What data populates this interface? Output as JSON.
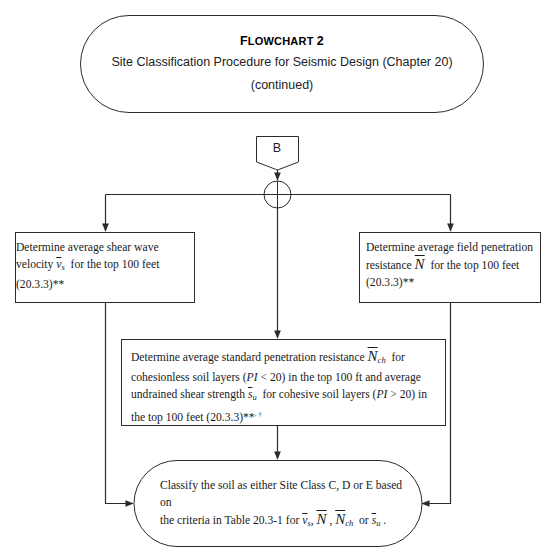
{
  "title_block": {
    "label_prefix": "F",
    "label_rest": "LOWCHART",
    "label_number": "2",
    "subtitle": "Site Classification Procedure for Seismic Design (Chapter 20)",
    "continuation": "(continued)"
  },
  "connector": {
    "label": "B"
  },
  "left_box": {
    "line1": "Determine average shear wave",
    "line2_pre": "velocity ",
    "symbol": "v",
    "symbol_sub": "s",
    "line2_post": "  for the top 100 feet",
    "line3": "(20.3.3)**"
  },
  "right_box": {
    "line1": "Determine average field penetration",
    "line2_pre": "resistance ",
    "symbol": "N",
    "line2_post": "  for the top 100 feet",
    "line3": "(20.3.3)**"
  },
  "middle_box": {
    "line1_pre": "Determine average standard penetration resistance ",
    "symbol1": "N",
    "symbol1_sub": "ch",
    "line1_post": "  for",
    "line2_pre": "cohesionless soil layers (",
    "pi": "PI",
    "line2_mid": " < 20) in the top 100 ft and average",
    "line3_pre": "undrained shear strength ",
    "symbol2": "s",
    "symbol2_sub": "u",
    "line3_mid": "  for cohesive soil layers (",
    "line3_post": " > 20) in",
    "line4": "the top 100 feet (20.3.3)**",
    "line4_sup": ", †"
  },
  "end_box": {
    "line1": "Classify the soil as either Site Class C, D or E based on",
    "line2_pre": "the criteria in Table 20.3-1 for ",
    "sym_v": "v",
    "sym_v_sub": "s",
    "sep1": ", ",
    "sym_N": "N",
    "sep2": " , ",
    "sym_Nch": "N",
    "sym_Nch_sub": "ch",
    "sep3": "  or ",
    "sym_s": "s",
    "sym_s_sub": "u",
    "end": " ."
  },
  "colors": {
    "stroke": "#2b2b2b",
    "text": "#1a1a1a",
    "background": "#ffffff"
  }
}
